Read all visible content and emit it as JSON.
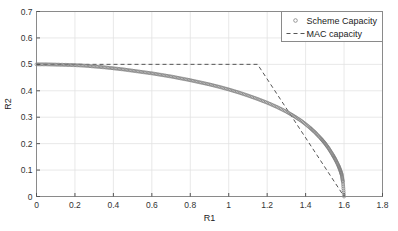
{
  "chart_data": {
    "type": "line",
    "title": "",
    "xlabel": "R1",
    "ylabel": "R2",
    "xlim": [
      0,
      1.8
    ],
    "ylim": [
      0,
      0.7
    ],
    "xticks": [
      "0",
      "0.2",
      "0.4",
      "0.6",
      "0.8",
      "1",
      "1.2",
      "1.4",
      "1.6",
      "1.8"
    ],
    "xtick_values": [
      0,
      0.2,
      0.4,
      0.6,
      0.8,
      1.0,
      1.2,
      1.4,
      1.6,
      1.8
    ],
    "yticks": [
      "0",
      "0.1",
      "0.2",
      "0.3",
      "0.4",
      "0.5",
      "0.6",
      "0.7"
    ],
    "ytick_values": [
      0,
      0.1,
      0.2,
      0.3,
      0.4,
      0.5,
      0.6,
      0.7
    ],
    "grid": true,
    "legend_position": "upper right",
    "series": [
      {
        "name": "Scheme Capacity",
        "style": "markers",
        "marker": "circle",
        "color": "#808080",
        "x": [
          0.0,
          0.05,
          0.1,
          0.15,
          0.2,
          0.25,
          0.3,
          0.35,
          0.4,
          0.45,
          0.5,
          0.55,
          0.6,
          0.65,
          0.7,
          0.75,
          0.8,
          0.85,
          0.9,
          0.95,
          1.0,
          1.05,
          1.1,
          1.15,
          1.2,
          1.25,
          1.3,
          1.34,
          1.38,
          1.42,
          1.45,
          1.48,
          1.5,
          1.52,
          1.54,
          1.555,
          1.57,
          1.58,
          1.588,
          1.594,
          1.6
        ],
        "y": [
          0.5,
          0.5,
          0.499,
          0.498,
          0.497,
          0.495,
          0.492,
          0.489,
          0.485,
          0.481,
          0.476,
          0.471,
          0.466,
          0.46,
          0.454,
          0.447,
          0.44,
          0.432,
          0.424,
          0.415,
          0.405,
          0.394,
          0.382,
          0.369,
          0.355,
          0.339,
          0.321,
          0.304,
          0.285,
          0.262,
          0.242,
          0.219,
          0.202,
          0.182,
          0.159,
          0.14,
          0.118,
          0.1,
          0.082,
          0.055,
          0.0
        ]
      },
      {
        "name": "MAC capacity",
        "style": "dashed",
        "color": "#555555",
        "x": [
          0.0,
          1.15,
          1.6
        ],
        "y": [
          0.5,
          0.5,
          0.0
        ]
      }
    ]
  },
  "legend": {
    "entries": [
      {
        "label": "Scheme Capacity",
        "marker": "circle"
      },
      {
        "label": "MAC capacity",
        "marker": "dashed-line"
      }
    ]
  },
  "axes": {
    "x_title": "R1",
    "y_title": "R2"
  }
}
